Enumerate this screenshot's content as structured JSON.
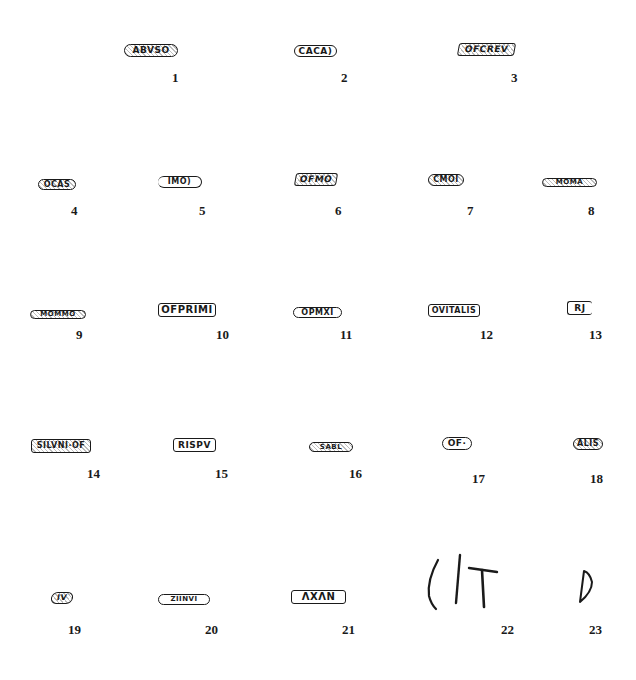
{
  "figure": {
    "type": "plate of potters' stamps",
    "ink_color": "#1a1a1a",
    "background": "#ffffff"
  },
  "stamps": [
    {
      "number": "1",
      "text": "ABVSO",
      "shape": "oval"
    },
    {
      "number": "2",
      "text": "CACA)",
      "shape": "oval"
    },
    {
      "number": "3",
      "text": "OFCREV",
      "shape": "rect"
    },
    {
      "number": "4",
      "text": "OCAS",
      "shape": "oval"
    },
    {
      "number": "5",
      "text": "IMO)",
      "shape": "oval"
    },
    {
      "number": "6",
      "text": "OFMO",
      "shape": "rect"
    },
    {
      "number": "7",
      "text": "CMOI",
      "shape": "oval"
    },
    {
      "number": "8",
      "text": "MOMA",
      "shape": "oval"
    },
    {
      "number": "9",
      "text": "MOMMO",
      "shape": "oval"
    },
    {
      "number": "10",
      "text": "OFPRIMI",
      "shape": "rect"
    },
    {
      "number": "11",
      "text": "OPMXI",
      "shape": "oval"
    },
    {
      "number": "12",
      "text": "OVITALIS",
      "shape": "rect"
    },
    {
      "number": "13",
      "text": "RJ",
      "shape": "rect"
    },
    {
      "number": "14",
      "text": "SILVNI·OF",
      "shape": "rect"
    },
    {
      "number": "15",
      "text": "RISPV",
      "shape": "rect"
    },
    {
      "number": "16",
      "text": "SABL",
      "shape": "oval"
    },
    {
      "number": "17",
      "text": "OF·",
      "shape": "oval"
    },
    {
      "number": "18",
      "text": "ALIS",
      "shape": "oval"
    },
    {
      "number": "19",
      "text": "IV",
      "shape": "oval"
    },
    {
      "number": "20",
      "text": "ZIINVI",
      "shape": "oval"
    },
    {
      "number": "21",
      "text": "ΛXΛN",
      "shape": "rect"
    },
    {
      "number": "22",
      "text": "( I T",
      "shape": "graffito"
    },
    {
      "number": "23",
      "text": "D",
      "shape": "graffito"
    }
  ]
}
